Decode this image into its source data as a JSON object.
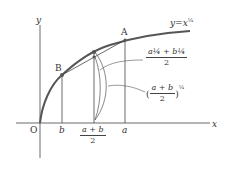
{
  "figure": {
    "axes": {
      "x_label": "x",
      "y_label": "y",
      "origin_label": "O"
    },
    "curve": {
      "label_y": "y",
      "label_eq": "=",
      "label_x": "x",
      "exponent": "¼"
    },
    "points": {
      "A": "A",
      "B": "B"
    },
    "x_ticks": {
      "b": "b",
      "mid_num": "a + b",
      "mid_den": "2",
      "a": "a"
    },
    "annotations": {
      "chord_mid": {
        "num": "a¼ + b¼",
        "den": "2"
      },
      "curve_mid": {
        "open": "(",
        "num": "a + b",
        "den": "2",
        "close": ")",
        "exp": "¼"
      }
    },
    "colors": {
      "curve": "#555555",
      "lines": "#444444",
      "background": "#ffffff"
    }
  }
}
